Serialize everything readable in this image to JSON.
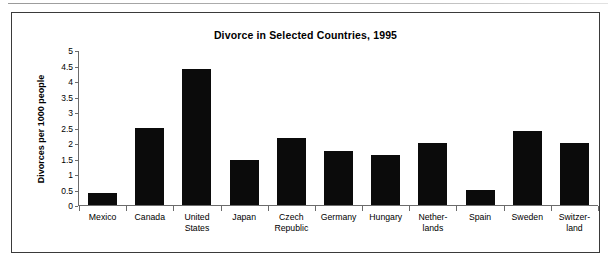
{
  "figure": {
    "title": "Divorce in Selected Countries, 1995",
    "y_axis_label": "Divorces per 1000 people"
  },
  "chart_data": {
    "type": "bar",
    "title": "Divorce in Selected Countries, 1995",
    "xlabel": "",
    "ylabel": "Divorces per 1000 people",
    "ylim": [
      0,
      5
    ],
    "ytick_step": 0.5,
    "yticks": [
      "0",
      "0.5",
      "1",
      "1.5",
      "2",
      "2.5",
      "3",
      "3.5",
      "4",
      "4.5",
      "5"
    ],
    "grid": false,
    "legend": "none",
    "bar_color": "#0b0b0b",
    "categories": [
      "Mexico",
      "Canada",
      "United States",
      "Japan",
      "Czech Republic",
      "Germany",
      "Hungary",
      "Netherlands",
      "Spain",
      "Sweden",
      "Switzerland"
    ],
    "category_labels": [
      [
        "Mexico"
      ],
      [
        "Canada"
      ],
      [
        "United",
        "States"
      ],
      [
        "Japan"
      ],
      [
        "Czech",
        "Republic"
      ],
      [
        "Germany"
      ],
      [
        "Hungary"
      ],
      [
        "Nether-",
        "lands"
      ],
      [
        "Spain"
      ],
      [
        "Sweden"
      ],
      [
        "Switzer-",
        "land"
      ]
    ],
    "values": [
      0.4,
      2.5,
      4.4,
      1.45,
      2.15,
      1.75,
      1.6,
      2.0,
      0.5,
      2.4,
      2.0
    ]
  }
}
